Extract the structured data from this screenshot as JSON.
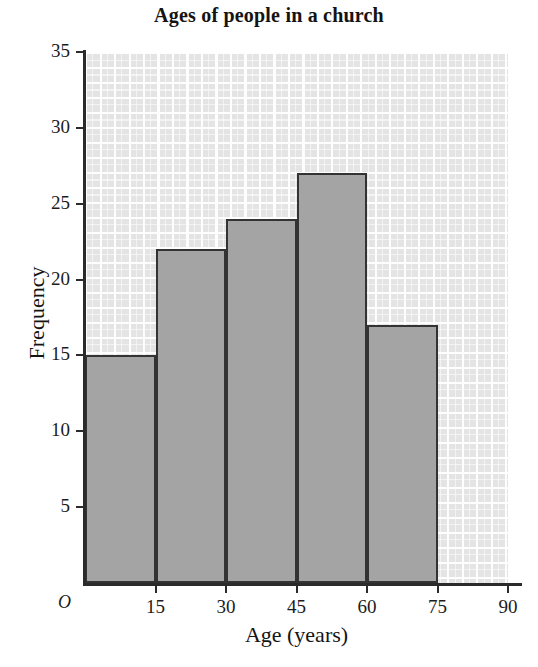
{
  "chart_data": {
    "type": "bar",
    "title": "Ages of people in a church",
    "xlabel": "Age (years)",
    "ylabel": "Frequency",
    "origin_label": "O",
    "categories": [
      "0-15",
      "15-30",
      "30-45",
      "45-60",
      "60-75"
    ],
    "bin_edges": [
      0,
      15,
      30,
      45,
      60,
      75
    ],
    "values": [
      15,
      22,
      24,
      27,
      17
    ],
    "xlim": [
      0,
      90
    ],
    "ylim": [
      0,
      35
    ],
    "xticks": [
      15,
      30,
      45,
      60,
      75,
      90
    ],
    "xtick_labels": [
      "15",
      "30",
      "45",
      "60",
      "75",
      "90"
    ],
    "yticks": [
      5,
      10,
      15,
      20,
      25,
      30,
      35
    ],
    "ytick_labels": [
      "5",
      "10",
      "15",
      "20",
      "25",
      "30",
      "35"
    ],
    "grid": true,
    "legend": false,
    "colors": {
      "bar_fill": "#a4a4a4",
      "bar_stroke": "#333333",
      "grid_background": "#e4e4e4",
      "grid_lines": "#ffffff",
      "axis": "#2b2b2b",
      "text": "#141414"
    }
  }
}
